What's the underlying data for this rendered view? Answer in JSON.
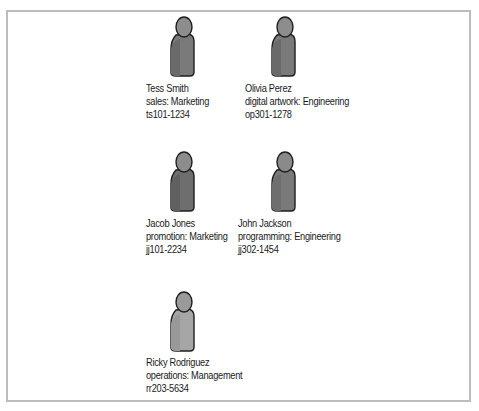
{
  "diagram": {
    "type": "org-chart-people",
    "colors": {
      "border": "#bdbdbd",
      "figure_outline": "#1f1f1f",
      "head_fill": "#8d8d8d",
      "body_dark": "#6e6e6e",
      "body_light": "#8a8a8a",
      "body_light_variant": "#a6a6a6"
    },
    "people": [
      {
        "name": "Tess Smith",
        "role": "sales: Marketing",
        "id": "ts101-1234",
        "icon": "person-icon"
      },
      {
        "name": "Olivia Perez",
        "role": "digital artwork: Engineering",
        "id": "op301-1278",
        "icon": "person-icon"
      },
      {
        "name": "Jacob Jones",
        "role": "promotion: Marketing",
        "id": "jj101-2234",
        "icon": "person-icon"
      },
      {
        "name": "John Jackson",
        "role": "programming: Engineering",
        "id": "jj302-1454",
        "icon": "person-icon"
      },
      {
        "name": "Ricky Rodriguez",
        "role": "operations: Management",
        "id": "rr203-5634",
        "icon": "person-icon"
      }
    ]
  }
}
